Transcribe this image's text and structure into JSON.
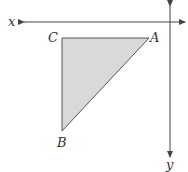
{
  "diagram": {
    "axes": {
      "x_label": "x",
      "y_label": "y"
    },
    "triangle": {
      "vertices": [
        {
          "name": "A",
          "x": 149,
          "y": 38
        },
        {
          "name": "B",
          "x": 62,
          "y": 131
        },
        {
          "name": "C",
          "x": 62,
          "y": 38
        }
      ],
      "labels": {
        "A": "A",
        "B": "B",
        "C": "C"
      },
      "fill": "#d9d9d9",
      "stroke": "#555555"
    },
    "colors": {
      "axis": "#444444",
      "text": "#333333"
    }
  }
}
